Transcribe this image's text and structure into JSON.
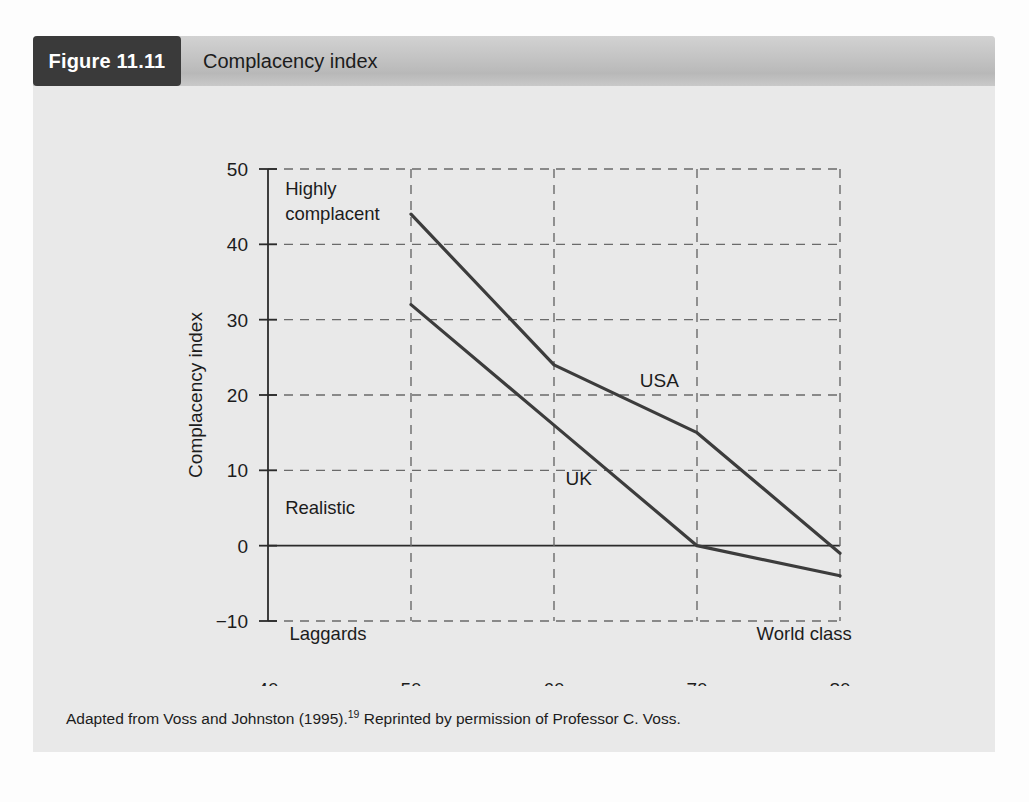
{
  "figure": {
    "badge_label": "Figure 11.11",
    "title": "Complacency index",
    "caption_prefix": "Adapted from Voss and Johnston (1995).",
    "caption_superscript": "19",
    "caption_suffix": " Reprinted by permission of Professor C. Voss."
  },
  "colors": {
    "badge_background": "#3a3a3a",
    "header_background": "#c3c3c3",
    "panel_background": "#e8e8e8",
    "line": "#3c3c3c",
    "grid": "#6a6a6a",
    "axis": "#2b2b2b",
    "text": "#1c1c1c"
  },
  "chart_data": {
    "type": "line",
    "title": "Complacency index",
    "xlabel": "Overall performance score",
    "ylabel": "Complacency index",
    "xlim": [
      40,
      80
    ],
    "ylim": [
      -10,
      50
    ],
    "xticks": [
      40,
      50,
      60,
      70,
      80
    ],
    "xtick_labels": [
      "40",
      "50",
      "60",
      "70",
      "80"
    ],
    "yticks": [
      -10,
      0,
      10,
      20,
      30,
      40,
      50
    ],
    "ytick_labels": [
      "−10",
      "0",
      "10",
      "20",
      "30",
      "40",
      "50"
    ],
    "grid": true,
    "grid_style": "dashed",
    "legend": "inline-annotations",
    "series": [
      {
        "name": "USA",
        "x": [
          50,
          60,
          70,
          80
        ],
        "values": [
          44,
          24,
          15,
          -1
        ],
        "label_x": 66,
        "label_y": 21
      },
      {
        "name": "UK",
        "x": [
          50,
          60,
          70,
          80
        ],
        "values": [
          32,
          16,
          0,
          -4
        ],
        "label_x": 60.8,
        "label_y": 8
      }
    ],
    "annotations": [
      {
        "name": "highly-complacent",
        "text_line1": "Highly",
        "text_line2": "complacent",
        "x": 41.2,
        "y": 46.5
      },
      {
        "name": "realistic",
        "text_line1": "Realistic",
        "text_line2": "",
        "x": 41.2,
        "y": 4.2
      },
      {
        "name": "laggards",
        "text_line1": "Laggards",
        "text_line2": "",
        "x": 41.5,
        "y": -12.5
      },
      {
        "name": "world-class",
        "text_line1": "World class",
        "text_line2": "",
        "x": 77.5,
        "y": -12.5
      }
    ]
  }
}
